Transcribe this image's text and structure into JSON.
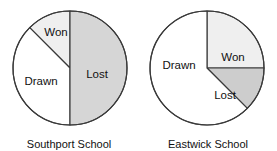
{
  "figure": {
    "width": 277,
    "height": 151,
    "background": "#ffffff"
  },
  "chart_data": [
    {
      "type": "pie",
      "title": "Southport School",
      "categories": [
        "Won",
        "Drawn",
        "Lost"
      ],
      "values": [
        12.5,
        37.5,
        50
      ],
      "units": "percent",
      "labels_shown": [
        "Won",
        "Drawn",
        "Lost"
      ],
      "start_angle_deg": 90,
      "direction": "counterclockwise",
      "colors": [
        "#efefef",
        "#ffffff",
        "#d6d6d6"
      ],
      "legend": "none",
      "grid": false
    },
    {
      "type": "pie",
      "title": "Eastwick School",
      "categories": [
        "Won",
        "Lost",
        "Drawn"
      ],
      "values": [
        25,
        12.5,
        62.5
      ],
      "units": "percent",
      "labels_shown": [
        "Won",
        "Lost",
        "Drawn"
      ],
      "start_angle_deg": 90,
      "direction": "clockwise",
      "colors": [
        "#efefef",
        "#cdcdcd",
        "#ffffff"
      ],
      "legend": "none",
      "grid": false
    }
  ],
  "charts": [
    {
      "id": "southport",
      "caption": "Southport School",
      "center": {
        "x": 70,
        "y": 68
      },
      "radius": 57,
      "slices": [
        {
          "name": "won",
          "label": "Won",
          "fill": "#efefef",
          "start_deg": 90,
          "end_deg": 135,
          "label_x": 56,
          "label_y": 33
        },
        {
          "name": "drawn",
          "label": "Drawn",
          "fill": "#ffffff",
          "start_deg": 135,
          "end_deg": 270,
          "label_x": 41,
          "label_y": 82
        },
        {
          "name": "lost",
          "label": "Lost",
          "fill": "#d6d6d6",
          "start_deg": 270,
          "end_deg": 450,
          "label_x": 97,
          "label_y": 75
        }
      ]
    },
    {
      "id": "eastwick",
      "caption": "Eastwick School",
      "center": {
        "x": 68,
        "y": 68
      },
      "radius": 57,
      "slices": [
        {
          "name": "won",
          "label": "Won",
          "fill": "#efefef",
          "start_deg": 0,
          "end_deg": 90,
          "label_x": 94,
          "label_y": 58
        },
        {
          "name": "lost",
          "label": "Lost",
          "fill": "#cdcdcd",
          "start_deg": -45,
          "end_deg": 0,
          "label_x": 86,
          "label_y": 96
        },
        {
          "name": "drawn",
          "label": "Drawn",
          "fill": "#ffffff",
          "start_deg": 90,
          "end_deg": 315,
          "label_x": 40,
          "label_y": 66
        }
      ]
    }
  ]
}
